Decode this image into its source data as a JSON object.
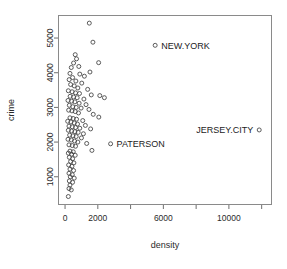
{
  "chart_data": {
    "type": "scatter",
    "title": "",
    "xlabel": "density",
    "ylabel": "crime",
    "xlim": [
      -400,
      12600
    ],
    "ylim": [
      200,
      5650
    ],
    "grid": false,
    "legend": null,
    "x_ticks": [
      0,
      2000,
      4000,
      6000,
      8000,
      10000,
      12000
    ],
    "x_tick_labels": [
      "0",
      "2000",
      "",
      "6000",
      "",
      "10000",
      ""
    ],
    "y_ticks": [
      1000,
      2000,
      3000,
      4000,
      5000
    ],
    "y_tick_labels": [
      "1000",
      "2000",
      "3000",
      "4000",
      "5000"
    ],
    "marker": "open-circle",
    "annotations": [
      {
        "label": "NEW.YORK",
        "x": 5500,
        "y": 4790,
        "label_side": "right"
      },
      {
        "label": "JERSEY.CITY",
        "x": 11850,
        "y": 2350,
        "label_side": "left"
      },
      {
        "label": "PATERSON",
        "x": 2780,
        "y": 1950,
        "label_side": "right"
      }
    ],
    "points": [
      [
        5500,
        4790
      ],
      [
        11850,
        2350
      ],
      [
        2780,
        1950
      ],
      [
        1480,
        5430
      ],
      [
        1700,
        4880
      ],
      [
        2050,
        4290
      ],
      [
        2400,
        3280
      ],
      [
        620,
        4520
      ],
      [
        700,
        4400
      ],
      [
        520,
        4280
      ],
      [
        840,
        4180
      ],
      [
        380,
        4150
      ],
      [
        300,
        3980
      ],
      [
        900,
        3960
      ],
      [
        1180,
        3900
      ],
      [
        1520,
        4020
      ],
      [
        460,
        3860
      ],
      [
        250,
        3800
      ],
      [
        660,
        3760
      ],
      [
        1020,
        3700
      ],
      [
        340,
        3660
      ],
      [
        560,
        3620
      ],
      [
        780,
        3560
      ],
      [
        1380,
        3520
      ],
      [
        200,
        3480
      ],
      [
        430,
        3450
      ],
      [
        640,
        3420
      ],
      [
        880,
        3400
      ],
      [
        1600,
        3360
      ],
      [
        2120,
        3340
      ],
      [
        310,
        3320
      ],
      [
        520,
        3300
      ],
      [
        740,
        3280
      ],
      [
        1150,
        3240
      ],
      [
        180,
        3200
      ],
      [
        400,
        3180
      ],
      [
        600,
        3160
      ],
      [
        860,
        3120
      ],
      [
        1280,
        3080
      ],
      [
        260,
        3060
      ],
      [
        470,
        3020
      ],
      [
        680,
        3000
      ],
      [
        980,
        2980
      ],
      [
        1460,
        2940
      ],
      [
        220,
        2920
      ],
      [
        420,
        2900
      ],
      [
        620,
        2880
      ],
      [
        820,
        2840
      ],
      [
        1720,
        2800
      ],
      [
        2060,
        2720
      ],
      [
        300,
        2700
      ],
      [
        500,
        2680
      ],
      [
        700,
        2660
      ],
      [
        1080,
        2620
      ],
      [
        160,
        2600
      ],
      [
        360,
        2580
      ],
      [
        560,
        2550
      ],
      [
        760,
        2520
      ],
      [
        1240,
        2480
      ],
      [
        240,
        2460
      ],
      [
        440,
        2440
      ],
      [
        640,
        2420
      ],
      [
        900,
        2400
      ],
      [
        1560,
        2380
      ],
      [
        200,
        2340
      ],
      [
        400,
        2320
      ],
      [
        600,
        2300
      ],
      [
        800,
        2280
      ],
      [
        1120,
        2240
      ],
      [
        280,
        2200
      ],
      [
        480,
        2180
      ],
      [
        680,
        2160
      ],
      [
        1000,
        2120
      ],
      [
        180,
        2080
      ],
      [
        380,
        2060
      ],
      [
        580,
        2030
      ],
      [
        780,
        2000
      ],
      [
        1320,
        1960
      ],
      [
        240,
        1920
      ],
      [
        440,
        1900
      ],
      [
        640,
        1880
      ],
      [
        1640,
        1760
      ],
      [
        300,
        1740
      ],
      [
        500,
        1720
      ],
      [
        200,
        1680
      ],
      [
        400,
        1650
      ],
      [
        620,
        1620
      ],
      [
        260,
        1560
      ],
      [
        460,
        1520
      ],
      [
        340,
        1440
      ],
      [
        540,
        1400
      ],
      [
        220,
        1340
      ],
      [
        420,
        1300
      ],
      [
        300,
        1220
      ],
      [
        520,
        1180
      ],
      [
        240,
        1100
      ],
      [
        440,
        1060
      ],
      [
        320,
        1000
      ],
      [
        560,
        960
      ],
      [
        260,
        880
      ],
      [
        460,
        840
      ],
      [
        300,
        760
      ],
      [
        240,
        660
      ],
      [
        380,
        620
      ],
      [
        200,
        430
      ]
    ]
  }
}
